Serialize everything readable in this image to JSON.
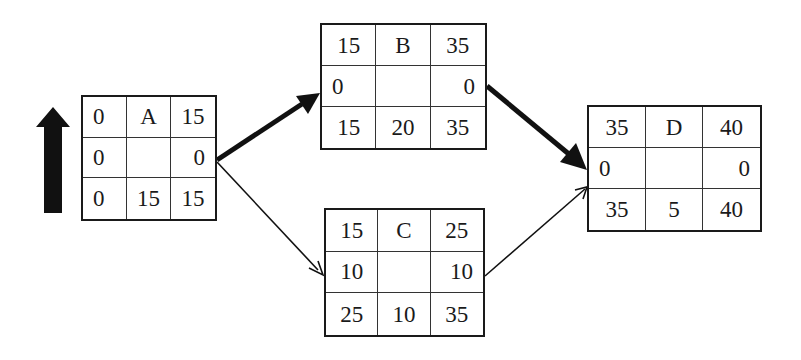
{
  "diagram": {
    "type": "activity-on-node network (critical path)",
    "legend_arrow": "up-arrow",
    "nodes": {
      "A": {
        "es": "0",
        "name": "A",
        "ef": "15",
        "ls_slack": "0",
        "lf_slack": "0",
        "ls": "0",
        "duration": "15",
        "lf": "15"
      },
      "B": {
        "es": "15",
        "name": "B",
        "ef": "35",
        "ls_slack": "0",
        "lf_slack": "0",
        "ls": "15",
        "duration": "20",
        "lf": "35"
      },
      "C": {
        "es": "15",
        "name": "C",
        "ef": "25",
        "ls_slack": "10",
        "lf_slack": "10",
        "ls": "25",
        "duration": "10",
        "lf": "35"
      },
      "D": {
        "es": "35",
        "name": "D",
        "ef": "40",
        "ls_slack": "0",
        "lf_slack": "0",
        "ls": "35",
        "duration": "5",
        "lf": "40"
      }
    },
    "edges": [
      {
        "from": "A",
        "to": "B",
        "critical": true
      },
      {
        "from": "A",
        "to": "C",
        "critical": false
      },
      {
        "from": "B",
        "to": "D",
        "critical": true
      },
      {
        "from": "C",
        "to": "D",
        "critical": false
      }
    ],
    "colors": {
      "line": "#1a1a1a",
      "background": "#ffffff"
    }
  }
}
